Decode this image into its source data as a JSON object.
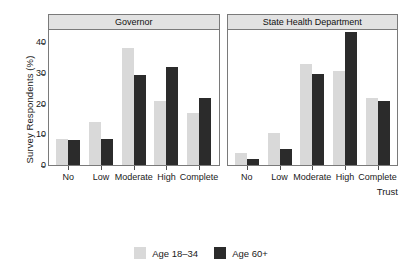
{
  "chart_data": {
    "type": "bar",
    "title": "",
    "xlabel": "Trust",
    "ylabel": "Survey Respondents (%)",
    "categories": [
      "No",
      "Low",
      "Moderate",
      "High",
      "Complete"
    ],
    "ylim": [
      0,
      45
    ],
    "yticks": [
      0,
      10,
      20,
      30,
      40
    ],
    "grid": false,
    "legend_position": "bottom",
    "panels": [
      {
        "title": "Governor",
        "series": [
          {
            "name": "Age 18–34",
            "color": "#d9d9d9",
            "values": [
              8.6,
              14.1,
              38.3,
              21.0,
              17.1
            ]
          },
          {
            "name": "Age 60+",
            "color": "#2b2b2b",
            "values": [
              8.0,
              8.6,
              29.4,
              31.9,
              21.8
            ]
          }
        ]
      },
      {
        "title": "State Health Department",
        "series": [
          {
            "name": "Age 18–34",
            "color": "#d9d9d9",
            "values": [
              3.9,
              10.6,
              33.1,
              30.8,
              21.8
            ]
          },
          {
            "name": "Age 60+",
            "color": "#2b2b2b",
            "values": [
              2.1,
              5.3,
              29.8,
              43.5,
              20.8
            ]
          }
        ]
      }
    ],
    "legend": [
      {
        "label": "Age 18–34",
        "color": "#d9d9d9"
      },
      {
        "label": "Age 60+",
        "color": "#2b2b2b"
      }
    ]
  }
}
